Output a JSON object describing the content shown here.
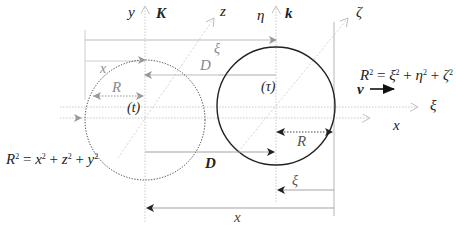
{
  "figure": {
    "frames": {
      "stationary": {
        "frame_label": "K",
        "circle_label": "(t)",
        "axes": {
          "vertical": "y",
          "diagonal": "z",
          "horizontal": "x"
        },
        "radius_label": "R",
        "arc_label": "x",
        "equation": {
          "lhs": "R",
          "terms": [
            "x",
            "z",
            "y"
          ],
          "text": "R² = x² + z² + y²"
        },
        "circle_style": "dotted"
      },
      "moving": {
        "frame_label": "k",
        "circle_label": "(τ)",
        "axes": {
          "vertical": "η",
          "diagonal": "ζ",
          "horizontal": "ξ"
        },
        "radius_label": "R",
        "equation": {
          "lhs": "R",
          "terms": [
            "ξ",
            "η",
            "ζ"
          ],
          "text": "R² = ξ² + η² + ζ²"
        },
        "circle_style": "solid"
      }
    },
    "velocity_label": "v",
    "distance_labels": {
      "upper_xi": "ξ",
      "upper_D": "D",
      "lower_D": "D",
      "lower_xi": "ξ",
      "bottom_x": "x",
      "right_radius": "R"
    },
    "colors": {
      "solid_line": "#222222",
      "grey_line": "#b5b5b5",
      "dotted_axis": "#bdbdbd",
      "text": "#222222",
      "grey_text": "#8a8a8a"
    }
  }
}
